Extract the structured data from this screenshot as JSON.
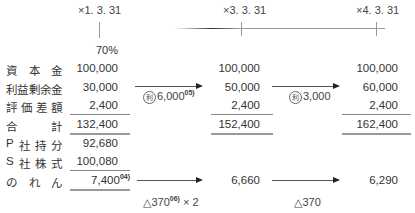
{
  "dates": {
    "d1": "×1. 3. 31",
    "d2": "×3. 3. 31",
    "d3": "×4. 3. 31"
  },
  "ownership": "70%",
  "rows": {
    "capital": {
      "label": [
        "資",
        "本",
        "金"
      ],
      "c1": "100,000",
      "c2": "100,000",
      "c3": "100,000"
    },
    "retained": {
      "label": [
        "利",
        "益",
        "剰",
        "余",
        "金"
      ],
      "c1": "30,000",
      "c2": "50,000",
      "c3": "60,000"
    },
    "valuation": {
      "label": [
        "評",
        "価",
        "差",
        "額"
      ],
      "c1": "2,400",
      "c2": "2,400",
      "c3": "2,400"
    },
    "total": {
      "label": [
        "合",
        "計"
      ],
      "c1": "132,400",
      "c2": "152,400",
      "c3": "162,400"
    },
    "p_share": {
      "label": [
        "P",
        "社",
        "持",
        "分"
      ],
      "c1": "92,680"
    },
    "s_stock": {
      "label": [
        "S",
        "社",
        "株",
        "式"
      ],
      "c1": "100,080"
    },
    "goodwill": {
      "label": [
        "の",
        "れ",
        "ん"
      ],
      "c1": "7,400",
      "c1_note": "04)",
      "c2": "6,660",
      "c3": "6,290"
    }
  },
  "annotations": {
    "retained_1": {
      "circled": "利",
      "value": "6,000",
      "note": "05)"
    },
    "retained_2": {
      "circled": "利",
      "value": "3,000"
    },
    "goodwill_1": {
      "value": "△370",
      "note": "06)",
      "suffix": "× 2"
    },
    "goodwill_2": {
      "value": "△370"
    }
  }
}
